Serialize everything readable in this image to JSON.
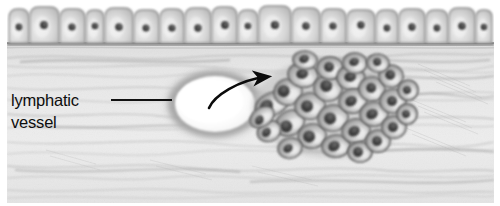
{
  "figure": {
    "width": 500,
    "height": 206,
    "background_color": "#ffffff"
  },
  "annotation": {
    "label_line_1": "lymphatic",
    "label_line_2": "vessel",
    "text_color": "#0d0d0d",
    "leader_line": {
      "name": "leader-line",
      "x1": 112,
      "y1": 100,
      "x2": 171,
      "y2": 100,
      "color": "#111111",
      "width": 2
    }
  },
  "arrow": {
    "name": "invasion-arrow",
    "path": "M 209 108 C 214 96, 238 80, 266 77",
    "color": "#0b0b0b",
    "head_x": 272,
    "head_y": 76,
    "description": "curved arrow from lymphatic vessel lumen toward tumor cluster"
  },
  "epithelium": {
    "name": "surface-epithelium",
    "cell_count": 20,
    "top_y": 8,
    "bottom_y": 43,
    "cell_fill": "#d9d9d9",
    "cell_stroke": "#8e8e8e",
    "nucleus_color": "#4b4b4b",
    "cells": [
      {
        "x": 9,
        "w": 20,
        "h": 34,
        "nx": 19,
        "ny": 27,
        "nr": 3.4
      },
      {
        "x": 30,
        "w": 29,
        "h": 36,
        "nx": 44,
        "ny": 25,
        "nr": 3.9
      },
      {
        "x": 60,
        "w": 25,
        "h": 34,
        "nx": 72,
        "ny": 27,
        "nr": 3.6
      },
      {
        "x": 86,
        "w": 18,
        "h": 33,
        "nx": 95,
        "ny": 26,
        "nr": 3.3
      },
      {
        "x": 105,
        "w": 28,
        "h": 35,
        "nx": 119,
        "ny": 27,
        "nr": 3.8
      },
      {
        "x": 134,
        "w": 25,
        "h": 33,
        "nx": 146,
        "ny": 28,
        "nr": 3.5
      },
      {
        "x": 160,
        "w": 24,
        "h": 34,
        "nx": 172,
        "ny": 28,
        "nr": 3.6
      },
      {
        "x": 185,
        "w": 26,
        "h": 35,
        "nx": 198,
        "ny": 28,
        "nr": 3.7
      },
      {
        "x": 212,
        "w": 25,
        "h": 36,
        "nx": 225,
        "ny": 25,
        "nr": 3.9
      },
      {
        "x": 238,
        "w": 20,
        "h": 33,
        "nx": 248,
        "ny": 26,
        "nr": 3.3
      },
      {
        "x": 259,
        "w": 32,
        "h": 37,
        "nx": 275,
        "ny": 25,
        "nr": 4.1
      },
      {
        "x": 292,
        "w": 28,
        "h": 35,
        "nx": 306,
        "ny": 26,
        "nr": 3.8
      },
      {
        "x": 321,
        "w": 25,
        "h": 34,
        "nx": 333,
        "ny": 26,
        "nr": 3.6
      },
      {
        "x": 347,
        "w": 28,
        "h": 33,
        "nx": 361,
        "ny": 25,
        "nr": 3.7
      },
      {
        "x": 376,
        "w": 22,
        "h": 33,
        "nx": 387,
        "ny": 28,
        "nr": 3.4
      },
      {
        "x": 399,
        "w": 26,
        "h": 34,
        "nx": 412,
        "ny": 27,
        "nr": 3.7
      },
      {
        "x": 426,
        "w": 22,
        "h": 33,
        "nx": 437,
        "ny": 28,
        "nr": 3.4
      },
      {
        "x": 449,
        "w": 26,
        "h": 35,
        "nx": 462,
        "ny": 26,
        "nr": 3.8
      },
      {
        "x": 476,
        "w": 16,
        "h": 33,
        "nx": 484,
        "ny": 27,
        "nr": 3.2
      }
    ]
  },
  "basement_membrane": {
    "name": "basement-membrane",
    "y": 44,
    "color": "#6f6f6f"
  },
  "stroma": {
    "name": "connective-tissue-stroma",
    "base_color": "#e9e9e9",
    "fiber_color": "#a9a9a9",
    "top_y": 46,
    "bottom_y": 200
  },
  "lymphatic_vessel": {
    "name": "lymphatic-vessel",
    "center_x": 215,
    "center_y": 104,
    "lumen_rx": 40,
    "lumen_ry": 28,
    "wall_rx": 55,
    "wall_ry": 40,
    "lumen_color": "#ffffff",
    "wall_color": "#9c9c9c"
  },
  "tumor_cluster": {
    "name": "tumor-cell-cluster",
    "cell_count": 28,
    "bounds": {
      "x": 256,
      "y": 60,
      "w": 152,
      "h": 92
    },
    "cell_fill": "#c2c2c2",
    "cell_stroke": "#5c5c5c",
    "nucleus_color": "#3a3a3a",
    "cells": [
      {
        "cx": 272,
        "cy": 104,
        "rx": 17,
        "ry": 11,
        "rot": -22,
        "nx": 266,
        "ny": 104,
        "nrx": 7,
        "nry": 6
      },
      {
        "cx": 290,
        "cy": 123,
        "rx": 15,
        "ry": 12,
        "rot": -30,
        "nx": 285,
        "ny": 124,
        "nrx": 6,
        "nry": 6
      },
      {
        "cx": 288,
        "cy": 92,
        "rx": 14,
        "ry": 13,
        "rot": -15,
        "nx": 284,
        "ny": 90,
        "nrx": 6,
        "nry": 6
      },
      {
        "cx": 303,
        "cy": 75,
        "rx": 15,
        "ry": 12,
        "rot": 10,
        "nx": 302,
        "ny": 74,
        "nrx": 6,
        "nry": 5
      },
      {
        "cx": 310,
        "cy": 106,
        "rx": 15,
        "ry": 13,
        "rot": -5,
        "nx": 307,
        "ny": 106,
        "nrx": 6,
        "nry": 6
      },
      {
        "cx": 312,
        "cy": 136,
        "rx": 14,
        "ry": 12,
        "rot": -10,
        "nx": 309,
        "ny": 136,
        "nrx": 6,
        "nry": 6
      },
      {
        "cx": 328,
        "cy": 88,
        "rx": 14,
        "ry": 13,
        "rot": 5,
        "nx": 326,
        "ny": 86,
        "nrx": 6,
        "nry": 6
      },
      {
        "cx": 330,
        "cy": 68,
        "rx": 13,
        "ry": 11,
        "rot": 0,
        "nx": 329,
        "ny": 67,
        "nrx": 5,
        "nry": 5
      },
      {
        "cx": 333,
        "cy": 118,
        "rx": 15,
        "ry": 13,
        "rot": -8,
        "nx": 330,
        "ny": 118,
        "nrx": 6,
        "nry": 6
      },
      {
        "cx": 336,
        "cy": 146,
        "rx": 14,
        "ry": 11,
        "rot": -5,
        "nx": 334,
        "ny": 146,
        "nrx": 6,
        "nry": 5
      },
      {
        "cx": 351,
        "cy": 78,
        "rx": 14,
        "ry": 12,
        "rot": 12,
        "nx": 350,
        "ny": 77,
        "nrx": 6,
        "nry": 5
      },
      {
        "cx": 353,
        "cy": 101,
        "rx": 14,
        "ry": 12,
        "rot": -6,
        "nx": 351,
        "ny": 101,
        "nrx": 6,
        "nry": 5
      },
      {
        "cx": 356,
        "cy": 131,
        "rx": 14,
        "ry": 12,
        "rot": -8,
        "nx": 354,
        "ny": 131,
        "nrx": 6,
        "nry": 5
      },
      {
        "cx": 360,
        "cy": 152,
        "rx": 12,
        "ry": 10,
        "rot": 0,
        "nx": 358,
        "ny": 152,
        "nrx": 5,
        "nry": 5
      },
      {
        "cx": 372,
        "cy": 89,
        "rx": 13,
        "ry": 12,
        "rot": 8,
        "nx": 371,
        "ny": 88,
        "nrx": 5,
        "nry": 5
      },
      {
        "cx": 374,
        "cy": 114,
        "rx": 14,
        "ry": 12,
        "rot": -4,
        "nx": 372,
        "ny": 114,
        "nrx": 6,
        "nry": 5
      },
      {
        "cx": 378,
        "cy": 141,
        "rx": 12,
        "ry": 11,
        "rot": -6,
        "nx": 377,
        "ny": 141,
        "nrx": 5,
        "nry": 5
      },
      {
        "cx": 355,
        "cy": 63,
        "rx": 12,
        "ry": 10,
        "rot": 6,
        "nx": 354,
        "ny": 62,
        "nrx": 5,
        "nry": 4
      },
      {
        "cx": 391,
        "cy": 76,
        "rx": 12,
        "ry": 11,
        "rot": 10,
        "nx": 390,
        "ny": 75,
        "nrx": 5,
        "nry": 5
      },
      {
        "cx": 393,
        "cy": 101,
        "rx": 13,
        "ry": 12,
        "rot": -3,
        "nx": 392,
        "ny": 101,
        "nrx": 5,
        "nry": 5
      },
      {
        "cx": 394,
        "cy": 127,
        "rx": 12,
        "ry": 11,
        "rot": -5,
        "nx": 393,
        "ny": 127,
        "nrx": 5,
        "nry": 5
      },
      {
        "cx": 305,
        "cy": 60,
        "rx": 12,
        "ry": 9,
        "rot": 4,
        "nx": 304,
        "ny": 59,
        "nrx": 5,
        "nry": 4
      },
      {
        "cx": 290,
        "cy": 148,
        "rx": 12,
        "ry": 10,
        "rot": -12,
        "nx": 288,
        "ny": 148,
        "nrx": 5,
        "nry": 4
      },
      {
        "cx": 269,
        "cy": 131,
        "rx": 12,
        "ry": 10,
        "rot": -28,
        "nx": 266,
        "ny": 131,
        "nrx": 5,
        "nry": 4
      },
      {
        "cx": 262,
        "cy": 117,
        "rx": 13,
        "ry": 9,
        "rot": -35,
        "nx": 258,
        "ny": 118,
        "nrx": 5,
        "nry": 4
      },
      {
        "cx": 408,
        "cy": 90,
        "rx": 10,
        "ry": 10,
        "rot": 0,
        "nx": 407,
        "ny": 90,
        "nrx": 4,
        "nry": 4
      },
      {
        "cx": 407,
        "cy": 114,
        "rx": 10,
        "ry": 10,
        "rot": 0,
        "nx": 406,
        "ny": 114,
        "nrx": 4,
        "nry": 4
      },
      {
        "cx": 378,
        "cy": 63,
        "rx": 11,
        "ry": 9,
        "rot": 8,
        "nx": 377,
        "ny": 62,
        "nrx": 4,
        "nry": 4
      }
    ]
  }
}
